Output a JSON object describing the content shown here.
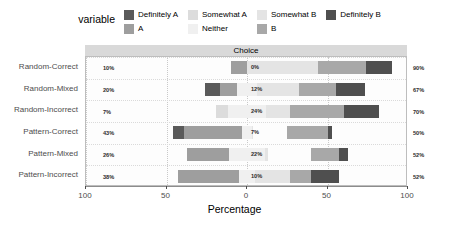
{
  "legend": {
    "title": "variable",
    "columns": [
      [
        {
          "label": "Definitely A",
          "color": "#5a5a5a"
        },
        {
          "label": "A",
          "color": "#9e9e9e"
        }
      ],
      [
        {
          "label": "Somewhat A",
          "color": "#dcdcdc"
        },
        {
          "label": "Neither",
          "color": "#f0f0f0"
        }
      ],
      [
        {
          "label": "Somewhat B",
          "color": "#e4e4e4"
        },
        {
          "label": "B",
          "color": "#a8a8a8"
        }
      ],
      [
        {
          "label": "Definitely B",
          "color": "#4f4f4f"
        }
      ]
    ]
  },
  "facet": {
    "strip_label": "Choice"
  },
  "axis": {
    "x_title": "Percentage",
    "x_ticks": [
      "100",
      "50",
      "0",
      "50",
      "100"
    ],
    "x_tick_values": [
      -100,
      -50,
      0,
      50,
      100
    ]
  },
  "chart_data": {
    "type": "bar",
    "subtype": "diverging-stacked-likert",
    "title": "Choice",
    "xlabel": "Percentage",
    "ylabel": "",
    "xlim": [
      -100,
      100
    ],
    "grid": true,
    "legend_position": "top",
    "legend_title": "variable",
    "categories": [
      "Random-Correct",
      "Random-Mixed",
      "Random-Incorrect",
      "Pattern-Correct",
      "Pattern-Mixed",
      "Pattern-Incorrect"
    ],
    "series": [
      {
        "name": "Definitely A",
        "color": "#5a5a5a",
        "values": [
          0,
          9,
          0,
          7,
          0,
          0
        ]
      },
      {
        "name": "A",
        "color": "#9e9e9e",
        "values": [
          10,
          11,
          0,
          36,
          26,
          38
        ]
      },
      {
        "name": "Somewhat A",
        "color": "#dcdcdc",
        "values": [
          0,
          0,
          7,
          0,
          0,
          0
        ]
      },
      {
        "name": "Neither",
        "color": "#f0f0f0",
        "values": [
          0,
          12,
          24,
          7,
          22,
          10
        ]
      },
      {
        "name": "Somewhat B",
        "color": "#e4e4e4",
        "values": [
          44,
          26,
          15,
          1,
          2,
          17
        ]
      },
      {
        "name": "B",
        "color": "#a8a8a8",
        "values": [
          30,
          23,
          33,
          46,
          40,
          15
        ]
      },
      {
        "name": "Definitely B",
        "color": "#4f4f4f",
        "values": [
          16,
          18,
          22,
          3,
          10,
          20
        ]
      }
    ],
    "rows": [
      {
        "label": "Random-Correct",
        "left_pct": "10%",
        "center_pct": "0%",
        "right_pct": "90%",
        "left_value": 10,
        "neither_value": 0,
        "right_value": 90,
        "segments": [
          {
            "name": "A",
            "color": "#9e9e9e",
            "from": -10,
            "to": 0
          },
          {
            "name": "Neither",
            "color": "#f0f0f0",
            "from": 0,
            "to": 0
          },
          {
            "name": "Somewhat B",
            "color": "#e4e4e4",
            "from": 0,
            "to": 44
          },
          {
            "name": "B",
            "color": "#a8a8a8",
            "from": 44,
            "to": 74
          },
          {
            "name": "Definitely B",
            "color": "#4f4f4f",
            "from": 74,
            "to": 90
          }
        ]
      },
      {
        "label": "Random-Mixed",
        "left_pct": "20%",
        "center_pct": "12%",
        "right_pct": "67%",
        "left_value": 20,
        "neither_value": 12,
        "right_value": 67,
        "segments": [
          {
            "name": "Definitely A",
            "color": "#5a5a5a",
            "from": -26,
            "to": -17
          },
          {
            "name": "A",
            "color": "#9e9e9e",
            "from": -17,
            "to": -6
          },
          {
            "name": "Neither",
            "color": "#f0f0f0",
            "from": -6,
            "to": 6
          },
          {
            "name": "Somewhat B",
            "color": "#e4e4e4",
            "from": 6,
            "to": 32
          },
          {
            "name": "B",
            "color": "#a8a8a8",
            "from": 32,
            "to": 55
          },
          {
            "name": "Definitely B",
            "color": "#4f4f4f",
            "from": 55,
            "to": 73
          }
        ]
      },
      {
        "label": "Random-Incorrect",
        "left_pct": "7%",
        "center_pct": "24%",
        "right_pct": "70%",
        "left_value": 7,
        "neither_value": 24,
        "right_value": 70,
        "segments": [
          {
            "name": "Somewhat A",
            "color": "#dcdcdc",
            "from": -19,
            "to": -12
          },
          {
            "name": "Neither",
            "color": "#f0f0f0",
            "from": -12,
            "to": 12
          },
          {
            "name": "Somewhat B",
            "color": "#e4e4e4",
            "from": 12,
            "to": 27
          },
          {
            "name": "B",
            "color": "#a8a8a8",
            "from": 27,
            "to": 60
          },
          {
            "name": "Definitely B",
            "color": "#4f4f4f",
            "from": 60,
            "to": 82
          }
        ]
      },
      {
        "label": "Pattern-Correct",
        "left_pct": "43%",
        "center_pct": "7%",
        "right_pct": "50%",
        "left_value": 43,
        "neither_value": 7,
        "right_value": 50,
        "segments": [
          {
            "name": "Definitely A",
            "color": "#5a5a5a",
            "from": -46,
            "to": -39
          },
          {
            "name": "A",
            "color": "#9e9e9e",
            "from": -39,
            "to": -3
          },
          {
            "name": "Neither",
            "color": "#f0f0f0",
            "from": -3,
            "to": 3
          },
          {
            "name": "Somewhat B",
            "color": "#e4e4e4",
            "from": 3,
            "to": 4
          },
          {
            "name": "B",
            "color": "#a8a8a8",
            "from": 25,
            "to": 50
          },
          {
            "name": "Definitely B",
            "color": "#4f4f4f",
            "from": 50,
            "to": 53
          }
        ]
      },
      {
        "label": "Pattern-Mixed",
        "left_pct": "26%",
        "center_pct": "22%",
        "right_pct": "52%",
        "left_value": 26,
        "neither_value": 22,
        "right_value": 52,
        "segments": [
          {
            "name": "A",
            "color": "#9e9e9e",
            "from": -37,
            "to": -11
          },
          {
            "name": "Neither",
            "color": "#f0f0f0",
            "from": -11,
            "to": 11
          },
          {
            "name": "Somewhat B",
            "color": "#e4e4e4",
            "from": 11,
            "to": 13
          },
          {
            "name": "B",
            "color": "#a8a8a8",
            "from": 40,
            "to": 57
          },
          {
            "name": "Definitely B",
            "color": "#4f4f4f",
            "from": 57,
            "to": 63
          }
        ]
      },
      {
        "label": "Pattern-Incorrect",
        "left_pct": "38%",
        "center_pct": "10%",
        "right_pct": "52%",
        "left_value": 38,
        "neither_value": 10,
        "right_value": 52,
        "segments": [
          {
            "name": "A",
            "color": "#9e9e9e",
            "from": -43,
            "to": -5
          },
          {
            "name": "Neither",
            "color": "#f0f0f0",
            "from": -5,
            "to": 5
          },
          {
            "name": "Somewhat B",
            "color": "#e4e4e4",
            "from": 5,
            "to": 27
          },
          {
            "name": "B",
            "color": "#a8a8a8",
            "from": 27,
            "to": 40
          },
          {
            "name": "Definitely B",
            "color": "#4f4f4f",
            "from": 40,
            "to": 57
          }
        ]
      }
    ]
  },
  "colors": {
    "panel_bg": "#fdfdfd",
    "strip_bg": "#d9d9d9",
    "page_bg": "#ffffff",
    "axis_text": "#4d4d4d",
    "label_text": "#2b2b2b"
  }
}
